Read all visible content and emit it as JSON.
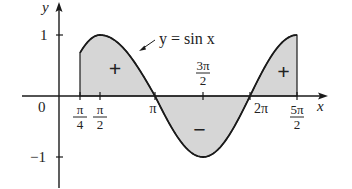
{
  "figure": {
    "type": "function-plot",
    "function_label": "y = sin x",
    "axes": {
      "x_label": "x",
      "y_label": "y",
      "origin_label": "0"
    },
    "y_ticks": [
      {
        "value": 1,
        "label": "1"
      },
      {
        "value": -1,
        "label": "−1"
      }
    ],
    "x_ticks": [
      {
        "value": 0.7853981634,
        "num": "π",
        "den": "4",
        "fraction": true
      },
      {
        "value": 1.5707963268,
        "num": "π",
        "den": "2",
        "fraction": true
      },
      {
        "value": 3.1415926536,
        "label": "π",
        "fraction": false
      },
      {
        "value": 4.7123889804,
        "num": "3π",
        "den": "2",
        "fraction": true,
        "above": true
      },
      {
        "value": 6.2831853072,
        "label": "2π",
        "fraction": false
      },
      {
        "value": 7.853981634,
        "num": "5π",
        "den": "2",
        "fraction": true
      }
    ],
    "shaded_interval": {
      "from": "π/4",
      "to": "5π/2"
    },
    "region_signs": [
      {
        "label": "+",
        "x": 2.0,
        "y": 0.45
      },
      {
        "label": "−",
        "x": 4.6,
        "y": -0.55
      },
      {
        "label": "+",
        "x": 7.4,
        "y": 0.4
      }
    ],
    "colors": {
      "curve": "#1a1a1a",
      "fill": "#d6d6d6",
      "axes": "#1a1a1a"
    }
  }
}
